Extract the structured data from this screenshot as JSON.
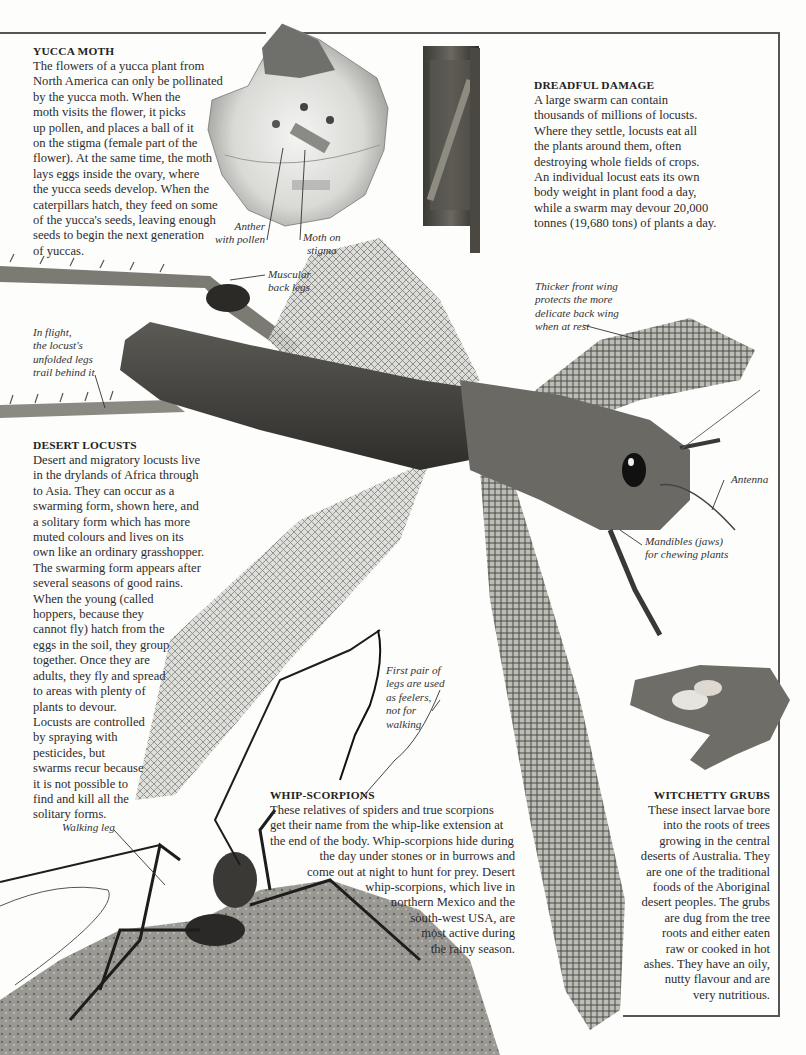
{
  "frame": {
    "stroke_color": "#555555"
  },
  "yucca_moth": {
    "heading": "YUCCA MOTH",
    "lines": [
      "The flowers of a yucca plant from",
      "North America can only be pollinated",
      "by the yucca moth. When the",
      "moth visits the flower, it picks",
      "up pollen, and places a ball of it",
      "on the stigma (female part of the",
      "flower). At the same time, the moth",
      "lays eggs inside the ovary, where",
      "the yucca seeds develop. When the",
      "caterpillars hatch, they feed on some",
      "of the yucca's seeds, leaving enough",
      "seeds to begin the next generation",
      "of yuccas."
    ]
  },
  "dreadful_damage": {
    "heading": "DREADFUL DAMAGE",
    "lines": [
      "A large swarm can contain",
      "thousands of millions of locusts.",
      "Where they settle, locusts eat all",
      "the plants around them, often",
      "destroying whole fields of crops.",
      "An individual locust eats its own",
      "body weight in plant food a day,",
      "while a swarm may devour 20,000",
      "tonnes (19,680 tons) of plants a day."
    ]
  },
  "desert_locusts": {
    "heading": "DESERT LOCUSTS",
    "lines": [
      "Desert and migratory locusts live",
      "in the drylands of Africa through",
      "to Asia. They can occur as a",
      "swarming form, shown here, and",
      "a solitary form which has more",
      "muted colours and lives on its",
      "own like an ordinary grasshopper.",
      "The swarming form appears after",
      "several seasons of good rains.",
      "When the young (called",
      "hoppers, because they",
      "cannot fly) hatch from the",
      "eggs in the soil, they group",
      "together. Once they are",
      "adults, they fly and spread",
      "to areas with plenty of",
      "plants to devour.",
      "Locusts are controlled",
      "by spraying with",
      "pesticides, but",
      "swarms recur because",
      "it is not possible to",
      "find and kill all the",
      "solitary forms."
    ]
  },
  "whip_scorpions": {
    "heading": "WHIP-SCORPIONS",
    "lines": [
      "These relatives of spiders and true scorpions",
      "get their name from the whip-like extension at",
      "the end of the body. Whip-scorpions hide during",
      "the day under stones or in burrows and",
      "come out at night to hunt for prey. Desert",
      "whip-scorpions, which live in",
      "northern Mexico and the",
      "south-west USA, are",
      "most active during",
      "the rainy season."
    ]
  },
  "witchetty_grubs": {
    "heading": "WITCHETTY GRUBS",
    "lines": [
      "These insect larvae bore",
      "into the roots of trees",
      "growing in the central",
      "deserts of Australia. They",
      "are one of the traditional",
      "foods of the Aboriginal",
      "desert peoples. The grubs",
      "are dug from the tree",
      "roots and either eaten",
      "raw or cooked in hot",
      "ashes. They have an oily,",
      "nutty flavour and are",
      "very nutritious."
    ]
  },
  "captions": {
    "anther": [
      "Anther",
      "with pollen"
    ],
    "moth_on_stigma": [
      "Moth on",
      "stigma"
    ],
    "muscular_back_legs": [
      "Muscular",
      "back legs"
    ],
    "in_flight": [
      "In flight,",
      "the locust's",
      "unfolded legs",
      "trail behind it"
    ],
    "thicker_front_wing": [
      "Thicker front wing",
      "protects the more",
      "delicate back wing",
      "when at rest"
    ],
    "antenna": [
      "Antenna"
    ],
    "mandibles": [
      "Mandibles (jaws)",
      "for chewing plants"
    ],
    "first_pair_legs": [
      "First pair of",
      "legs are used",
      "as feelers,",
      "not for",
      "walking"
    ],
    "walking_leg": [
      "Walking leg"
    ]
  },
  "images": {
    "yucca_flower": "yucca-flower-photo",
    "locust_covered_post": "locust-covered-post-photo",
    "desert_locust": "desert-locust-photo",
    "witchetty_grubs_in_hand": "witchetty-grubs-hand-photo",
    "whip_scorpion_on_rock": "whip-scorpion-rock-photo"
  }
}
